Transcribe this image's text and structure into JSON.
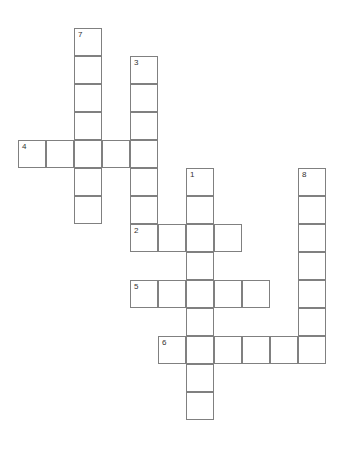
{
  "puzzle": {
    "title": "Crossword Grid",
    "cell_size": 28,
    "origin_x": 18,
    "origin_y": 28,
    "grid_cols": 12,
    "grid_rows": 15,
    "border_color": "#808080",
    "cell_fill": "#ffffff",
    "number_color": "#333333",
    "background": "#ffffff"
  },
  "entries": [
    {
      "number": "1",
      "direction": "down",
      "start_col": 6,
      "start_row": 5,
      "length": 9,
      "label": "1-down"
    },
    {
      "number": "2",
      "direction": "across",
      "start_col": 4,
      "start_row": 7,
      "length": 4,
      "label": "2-across"
    },
    {
      "number": "3",
      "direction": "down",
      "start_col": 4,
      "start_row": 1,
      "length": 7,
      "label": "3-down"
    },
    {
      "number": "4",
      "direction": "across",
      "start_col": 0,
      "start_row": 4,
      "length": 5,
      "label": "4-across"
    },
    {
      "number": "5",
      "direction": "across",
      "start_col": 4,
      "start_row": 9,
      "length": 5,
      "label": "5-across"
    },
    {
      "number": "6",
      "direction": "across",
      "start_col": 5,
      "start_row": 11,
      "length": 6,
      "label": "6-across"
    },
    {
      "number": "7",
      "direction": "down",
      "start_col": 2,
      "start_row": 0,
      "length": 7,
      "label": "7-down"
    },
    {
      "number": "8",
      "direction": "down",
      "start_col": 10,
      "start_row": 5,
      "length": 7,
      "label": "8-down"
    }
  ],
  "numbered_cells": [
    {
      "number": "7",
      "col": 2,
      "row": 0
    },
    {
      "number": "3",
      "col": 4,
      "row": 1
    },
    {
      "number": "4",
      "col": 0,
      "row": 4
    },
    {
      "number": "1",
      "col": 6,
      "row": 5
    },
    {
      "number": "8",
      "col": 10,
      "row": 5
    },
    {
      "number": "2",
      "col": 4,
      "row": 7
    },
    {
      "number": "5",
      "col": 4,
      "row": 9
    },
    {
      "number": "6",
      "col": 5,
      "row": 11
    }
  ]
}
